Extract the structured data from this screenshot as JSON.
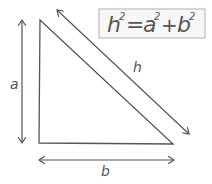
{
  "diagram": {
    "formula": {
      "lhs": "h",
      "lhs_exp": "2",
      "eq": "=",
      "a": "a",
      "a_exp": "2",
      "plus": "+",
      "b": "b",
      "b_exp": "2"
    },
    "labels": {
      "side_a": "a",
      "side_b": "b",
      "hypotenuse": "h"
    },
    "colors": {
      "stroke": "#555555",
      "box_border": "#b0b0b0",
      "box_fill": "#f7f7f7"
    }
  }
}
